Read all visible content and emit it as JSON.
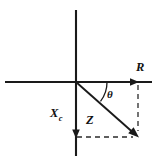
{
  "figure": {
    "kind": "impedance-phasor-diagram",
    "background_color": "#ffffff",
    "ink_color": "#1a1a1a",
    "width": 157,
    "height": 164
  },
  "labels": {
    "resistance": "R",
    "reactance_base": "X",
    "reactance_subscript": "c",
    "impedance": "Z",
    "angle": "θ"
  },
  "geometry": {
    "origin_x": 76,
    "origin_y": 82,
    "horizontal_axis": {
      "x1": 5,
      "y1": 82,
      "x2": 152,
      "y2": 82
    },
    "vertical_axis": {
      "x1": 76,
      "y1": 10,
      "x2": 76,
      "y2": 156
    },
    "r_vector": {
      "x1": 76,
      "y1": 82,
      "x2": 138,
      "y2": 82
    },
    "xc_vector": {
      "x1": 76,
      "y1": 82,
      "x2": 76,
      "y2": 137
    },
    "z_vector": {
      "x1": 76,
      "y1": 82,
      "x2": 138,
      "y2": 137
    },
    "dashed_horizontal": {
      "x1": 76,
      "y1": 137,
      "x2": 134,
      "y2": 137
    },
    "dashed_vertical": {
      "x1": 138,
      "y1": 86,
      "x2": 138,
      "y2": 133
    },
    "angle_arc_radius": 31
  },
  "label_positions": {
    "resistance": {
      "x": 136,
      "y": 71
    },
    "reactance": {
      "x": 50,
      "y": 117
    },
    "impedance": {
      "x": 86,
      "y": 124
    },
    "angle": {
      "x": 107,
      "y": 98
    }
  }
}
